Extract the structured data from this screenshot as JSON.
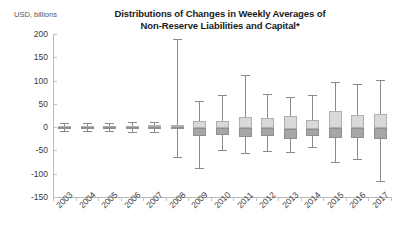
{
  "chart_data": {
    "type": "box",
    "title": "Distributions of Changes in Weekly Averages of Non-Reserve Liabilities and Capital*",
    "title_line1": "Distributions of Changes in Weekly Averages of",
    "title_line2": "Non-Reserve Liabilities and Capital*",
    "ylabel": "USD, billions",
    "xlabel": "",
    "ylim": [
      -150,
      200
    ],
    "yticks": [
      200,
      150,
      100,
      50,
      0,
      -50,
      -100,
      -150
    ],
    "ytick_labels": [
      "200",
      "150",
      "100",
      "50",
      "0",
      "-50",
      "-100",
      "-150"
    ],
    "grid": false,
    "legend": "none",
    "categories": [
      "2003",
      "2004",
      "2005",
      "2006",
      "2007",
      "2008",
      "2009",
      "2010",
      "2011",
      "2012",
      "2013",
      "2014",
      "2015",
      "2016",
      "2017"
    ],
    "boxes": [
      {
        "year": "2003",
        "whisker_low": -8,
        "q1": -3,
        "median": 0,
        "q3": 3,
        "whisker_high": 8
      },
      {
        "year": "2004",
        "whisker_low": -9,
        "q1": -3,
        "median": 0,
        "q3": 3,
        "whisker_high": 9
      },
      {
        "year": "2005",
        "whisker_low": -8,
        "q1": -3,
        "median": 0,
        "q3": 3,
        "whisker_high": 8
      },
      {
        "year": "2006",
        "whisker_low": -10,
        "q1": -3,
        "median": 0,
        "q3": 3,
        "whisker_high": 10
      },
      {
        "year": "2007",
        "whisker_low": -10,
        "q1": -4,
        "median": 0,
        "q3": 4,
        "whisker_high": 10
      },
      {
        "year": "2008",
        "whisker_low": -65,
        "q1": -5,
        "median": 0,
        "q3": 5,
        "whisker_high": 190
      },
      {
        "year": "2009",
        "whisker_low": -88,
        "q1": -18,
        "median": -2,
        "q3": 14,
        "whisker_high": 57
      },
      {
        "year": "2010",
        "whisker_low": -50,
        "q1": -17,
        "median": -2,
        "q3": 13,
        "whisker_high": 68
      },
      {
        "year": "2011",
        "whisker_low": -56,
        "q1": -21,
        "median": -2,
        "q3": 21,
        "whisker_high": 113
      },
      {
        "year": "2012",
        "whisker_low": -52,
        "q1": -20,
        "median": -2,
        "q3": 20,
        "whisker_high": 72
      },
      {
        "year": "2013",
        "whisker_low": -53,
        "q1": -25,
        "median": -3,
        "q3": 24,
        "whisker_high": 64
      },
      {
        "year": "2014",
        "whisker_low": -42,
        "q1": -19,
        "median": -3,
        "q3": 16,
        "whisker_high": 68
      },
      {
        "year": "2015",
        "whisker_low": -74,
        "q1": -23,
        "median": -2,
        "q3": 34,
        "whisker_high": 98
      },
      {
        "year": "2016",
        "whisker_low": -68,
        "q1": -24,
        "median": -2,
        "q3": 26,
        "whisker_high": 92
      },
      {
        "year": "2017",
        "whisker_low": -116,
        "q1": -26,
        "median": -1,
        "q3": 28,
        "whisker_high": 101
      }
    ],
    "colors": {
      "box_upper_fill": "#d9d9d9",
      "box_lower_fill": "#a6a6a6",
      "box_border": "#b0b0b0",
      "whisker": "#8a8a8a",
      "axis": "#b9b9b9",
      "text": "#3a3a3a",
      "title": "#1a1a1a"
    }
  }
}
